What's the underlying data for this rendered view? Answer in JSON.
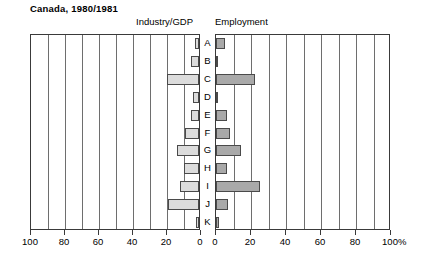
{
  "title": "Canada, 1980/1981",
  "panels": {
    "left": {
      "header": "Industry/GDP"
    },
    "right": {
      "header": "Employment"
    }
  },
  "axis": {
    "left_ticks": [
      "100",
      "80",
      "60",
      "40",
      "20",
      "0"
    ],
    "right_ticks": [
      "0",
      "20",
      "40",
      "60",
      "80",
      "100"
    ],
    "percent_symbol": "%"
  },
  "categories": [
    "A",
    "B",
    "C",
    "D",
    "E",
    "F",
    "G",
    "H",
    "I",
    "J",
    "K"
  ],
  "colors": {
    "bar_left": "#dcdcdc",
    "bar_right": "#a9a9a9",
    "frame": "#3a3a3a",
    "grid": "#6e6e6e"
  },
  "chart_data": {
    "type": "bar",
    "title": "Canada, 1980/1981",
    "subtype": "back-to-back horizontal bar (population pyramid style)",
    "categories": [
      "A",
      "B",
      "C",
      "D",
      "E",
      "F",
      "G",
      "H",
      "I",
      "J",
      "K"
    ],
    "series": [
      {
        "name": "Industry/GDP",
        "side": "left",
        "axis_direction": "reversed",
        "unit": "%",
        "values": [
          2.5,
          4.5,
          19,
          3.5,
          5,
          8.5,
          13,
          9,
          11,
          18,
          1.5
        ]
      },
      {
        "name": "Employment",
        "side": "right",
        "axis_direction": "normal",
        "unit": "%",
        "values": [
          5,
          0.5,
          22,
          0.5,
          6,
          8,
          14,
          6,
          25,
          7,
          1.5
        ]
      }
    ],
    "xlabel": "",
    "ylabel": "",
    "xlim_left": [
      100,
      0
    ],
    "xlim_right": [
      0,
      100
    ],
    "xticks_left": [
      100,
      80,
      60,
      40,
      20,
      0
    ],
    "xticks_right": [
      0,
      20,
      40,
      60,
      80,
      100
    ],
    "grid": true,
    "grid_interval": 10,
    "legend": "none"
  }
}
